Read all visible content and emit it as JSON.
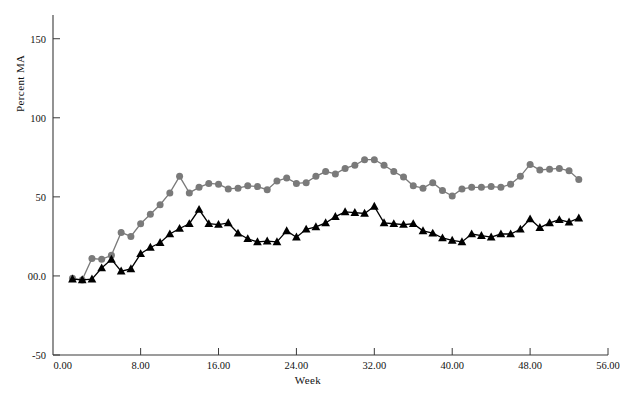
{
  "chart_data": {
    "type": "line",
    "title": "",
    "xlabel": "Week",
    "ylabel": "Percent MA",
    "xlim": [
      -1.0,
      56.0
    ],
    "ylim": [
      -50,
      165
    ],
    "xticks": [
      0,
      8,
      16,
      24,
      32,
      40,
      48,
      56
    ],
    "xticklabels": [
      "0.00",
      "8.00",
      "16.00",
      "24.00",
      "32.00",
      "40.00",
      "48.00",
      "56.00"
    ],
    "yticks": [
      -50,
      0,
      50,
      100,
      150
    ],
    "yticklabels": [
      "-50",
      "00.0",
      "50",
      "100",
      "150"
    ],
    "grid": false,
    "legend": "none",
    "frame": "left-bottom",
    "series": [
      {
        "name": "gray-circle-series",
        "marker": "circle",
        "color": "#7a7a7a",
        "line_color": "#7a7a7a",
        "x": [
          1,
          2,
          3,
          4,
          5,
          6,
          7,
          8,
          9,
          10,
          11,
          12,
          13,
          14,
          15,
          16,
          17,
          18,
          19,
          20,
          21,
          22,
          23,
          24,
          25,
          26,
          27,
          28,
          29,
          30,
          31,
          32,
          33,
          34,
          35,
          36,
          37,
          38,
          39,
          40,
          41,
          42,
          43,
          44,
          45,
          46,
          47,
          48,
          49,
          50,
          51,
          52,
          53
        ],
        "y": [
          -1.5,
          -2.5,
          11.0,
          10.5,
          13.0,
          27.5,
          25.0,
          33.0,
          39.0,
          45.0,
          52.5,
          63.0,
          52.5,
          56.0,
          58.5,
          58.0,
          55.0,
          55.5,
          57.0,
          56.5,
          54.5,
          60.0,
          62.0,
          58.5,
          59.0,
          63.0,
          66.0,
          64.5,
          68.0,
          70.0,
          73.5,
          73.5,
          70.0,
          66.0,
          62.5,
          57.0,
          55.5,
          59.0,
          54.0,
          50.5,
          55.0,
          56.0,
          56.0,
          56.5,
          56.0,
          58.0,
          63.0,
          70.5,
          67.0,
          67.5,
          68.0,
          66.5,
          61.0
        ]
      },
      {
        "name": "black-triangle-series",
        "marker": "triangle",
        "color": "#000000",
        "line_color": "#000000",
        "x": [
          1,
          2,
          3,
          4,
          5,
          6,
          7,
          8,
          9,
          10,
          11,
          12,
          13,
          14,
          15,
          16,
          17,
          18,
          19,
          20,
          21,
          22,
          23,
          24,
          25,
          26,
          27,
          28,
          29,
          30,
          31,
          32,
          33,
          34,
          35,
          36,
          37,
          38,
          39,
          40,
          41,
          42,
          43,
          44,
          45,
          46,
          47,
          48,
          49,
          50,
          51,
          52,
          53
        ],
        "y": [
          -2.0,
          -2.5,
          -2.0,
          5.0,
          10.5,
          3.0,
          4.5,
          14.0,
          18.0,
          21.0,
          26.5,
          30.0,
          33.0,
          42.0,
          33.0,
          32.5,
          33.5,
          27.0,
          23.5,
          21.5,
          22.0,
          21.5,
          28.5,
          24.5,
          29.5,
          31.0,
          33.5,
          37.5,
          40.5,
          40.0,
          39.5,
          44.0,
          33.5,
          33.0,
          32.5,
          33.0,
          28.5,
          27.0,
          24.0,
          22.5,
          21.5,
          26.5,
          25.5,
          24.5,
          26.5,
          26.5,
          29.5,
          36.0,
          30.5,
          33.5,
          35.5,
          34.0,
          36.5
        ]
      }
    ]
  }
}
